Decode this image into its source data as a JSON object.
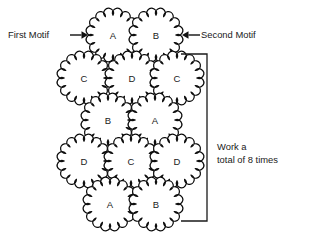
{
  "diagram": {
    "background_color": "#ffffff",
    "ink_color": "#111111",
    "motif": {
      "shape": "scalloped-flower-circle",
      "scallops": 16,
      "radius": 24,
      "scallop_depth": 4.2
    },
    "rows": [
      {
        "row_index": 1,
        "motifs": [
          {
            "label": "A",
            "cx": 113,
            "cy": 35
          },
          {
            "label": "B",
            "cx": 156,
            "cy": 35
          }
        ]
      },
      {
        "row_index": 2,
        "motifs": [
          {
            "label": "C",
            "cx": 84,
            "cy": 78
          },
          {
            "label": "D",
            "cx": 132,
            "cy": 78
          },
          {
            "label": "C",
            "cx": 177,
            "cy": 78
          }
        ]
      },
      {
        "row_index": 3,
        "motifs": [
          {
            "label": "B",
            "cx": 108,
            "cy": 120
          },
          {
            "label": "A",
            "cx": 155,
            "cy": 120
          }
        ]
      },
      {
        "row_index": 4,
        "motifs": [
          {
            "label": "D",
            "cx": 84,
            "cy": 161
          },
          {
            "label": "C",
            "cx": 131,
            "cy": 161
          },
          {
            "label": "D",
            "cx": 177,
            "cy": 161
          }
        ]
      },
      {
        "row_index": 5,
        "motifs": [
          {
            "label": "A",
            "cx": 110,
            "cy": 204
          },
          {
            "label": "B",
            "cx": 156,
            "cy": 204
          }
        ]
      }
    ],
    "annotations": {
      "first_motif": {
        "text": "First Motif",
        "arrow_direction": "right",
        "arrow_x1": 70,
        "arrow_x2": 88,
        "arrow_y": 35
      },
      "second_motif": {
        "text": "Second Motif",
        "arrow_direction": "left",
        "arrow_x1": 200,
        "arrow_x2": 182,
        "arrow_y": 35
      },
      "work_note": {
        "line1": "Work a",
        "line2": "total of 8 times"
      }
    },
    "bracket": {
      "x": 207,
      "y_top": 54,
      "y_bottom": 221,
      "tick_length": 26,
      "orientation": "right-side-vertical-with-left-ticks"
    }
  }
}
